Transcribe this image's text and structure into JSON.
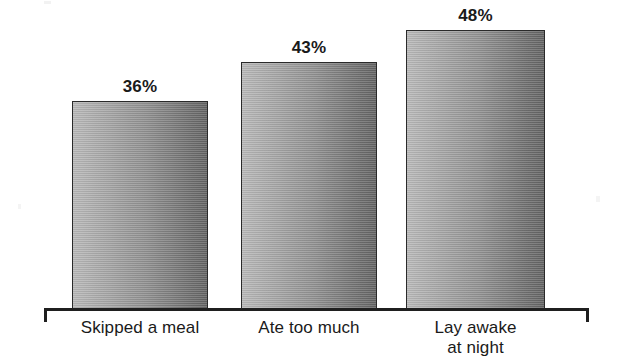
{
  "chart_data": {
    "type": "bar",
    "title": "",
    "subtitle": "",
    "xlabel": "",
    "ylabel": "",
    "ylim": [
      0,
      52
    ],
    "grid": false,
    "legend": false,
    "categories": [
      "Skipped a meal",
      "Ate too much",
      "Lay awake\nat night"
    ],
    "values": [
      36,
      43,
      48
    ],
    "value_labels": [
      "36%",
      "43%",
      "48%"
    ],
    "units": "percent",
    "bars": [
      {
        "category": "Skipped a meal",
        "value": 36,
        "label": "36%",
        "x": 72,
        "width": 136,
        "top": 101,
        "height": 209
      },
      {
        "category": "Ate too much",
        "value": 43,
        "label": "43%",
        "x": 241,
        "width": 136,
        "top": 62,
        "height": 248
      },
      {
        "category": "Lay awake\nat night",
        "value": 48,
        "label": "48%",
        "x": 406,
        "width": 139,
        "top": 30,
        "height": 280
      }
    ]
  },
  "style": {
    "background": "#ffffff",
    "bar_outline": "#2a2a2a",
    "bar_fill_light": "#b9b9b9",
    "bar_fill_dark": "#636363",
    "axis_color": "#1f1f1f",
    "text_color": "#1a1a1a"
  }
}
